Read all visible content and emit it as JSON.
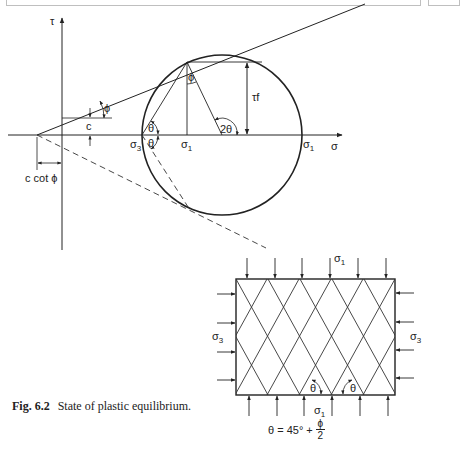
{
  "figure": {
    "number": "Fig. 6.2",
    "caption": "State of plastic equilibrium."
  },
  "mohr_diagram": {
    "axes": {
      "x_label": "σ",
      "y_label": "τ"
    },
    "labels": {
      "phi_envelope": "ϕ",
      "cohesion": "c",
      "c_cot_phi": "c cot ϕ",
      "sigma3": "σ3",
      "sigma1_center": "σ1",
      "sigma1_right": "σ1",
      "theta_upper": "θ",
      "theta_lower": "θ",
      "phi_inner": "ϕ",
      "two_theta": "2θ",
      "tau_f": "τf"
    }
  },
  "element": {
    "top_load": "σ1",
    "bottom_load": "σ1",
    "left_load": "σ3",
    "right_load": "σ3",
    "angle_left": "θ",
    "angle_right": "θ"
  },
  "formula": {
    "lhs": "θ = 45° +",
    "numerator": "ϕ",
    "denominator": "2"
  },
  "colors": {
    "line": "#222222",
    "frame": "#bfbfbf"
  }
}
